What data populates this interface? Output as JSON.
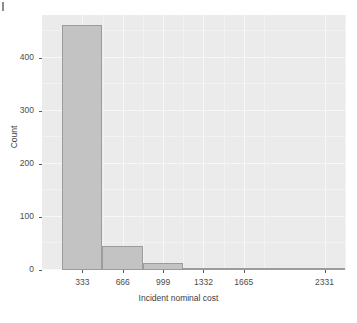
{
  "figure": {
    "background": "#ffffff",
    "panel_background": "#ebebeb",
    "bar_fill": "#c3c3c3",
    "bar_stroke": "#9c9c9c",
    "artifact_note": "mark"
  },
  "chart_data": {
    "type": "bar",
    "title": "",
    "subtitle": "",
    "xlabel": "Incident nominal cost",
    "ylabel": "Count",
    "grid": true,
    "legend": "none",
    "xlim": [
      0,
      2500
    ],
    "ylim": [
      0,
      480
    ],
    "ytick_labels": [
      "0",
      "100",
      "200",
      "300",
      "400"
    ],
    "ytick_values": [
      0,
      100,
      200,
      300,
      400
    ],
    "xtick_labels": [
      "333",
      "666",
      "999",
      "1332",
      "1665",
      "2331"
    ],
    "xtick_values": [
      333,
      666,
      999,
      1332,
      1665,
      2331
    ],
    "bin_width": 333,
    "categories": [
      "333",
      "666",
      "999",
      "1332",
      "1665",
      "1998",
      "2331"
    ],
    "bin_starts": [
      166,
      499,
      832,
      1165,
      1498,
      1831,
      2164
    ],
    "bin_ends": [
      499,
      832,
      1165,
      1498,
      1831,
      2164,
      2497
    ],
    "values": [
      462,
      45,
      13,
      3,
      2,
      1,
      1
    ]
  }
}
